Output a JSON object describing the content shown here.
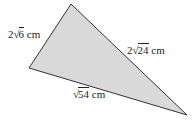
{
  "diagram": {
    "type": "triangle",
    "fill_color": "#d9d9d9",
    "stroke_color": "#333333",
    "vertices": {
      "top": [
        71,
        4
      ],
      "left": [
        29,
        68
      ],
      "right": [
        187,
        115
      ]
    },
    "sides": [
      {
        "id": "left-side",
        "between": [
          "top",
          "left"
        ],
        "coefficient": "2",
        "radical_symbol": "√",
        "radicand": "6",
        "unit": " cm",
        "text": "2√6 cm"
      },
      {
        "id": "right-side",
        "between": [
          "top",
          "right"
        ],
        "coefficient": "2",
        "radical_symbol": "√",
        "radicand": "24",
        "unit": " cm",
        "text": "2√24 cm"
      },
      {
        "id": "bottom-side",
        "between": [
          "left",
          "right"
        ],
        "coefficient": "",
        "radical_symbol": "√",
        "radicand": "54",
        "unit": " cm",
        "text": "√54 cm"
      }
    ]
  }
}
